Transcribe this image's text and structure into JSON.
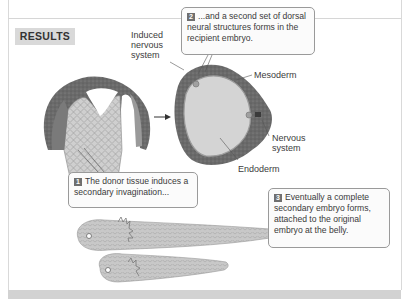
{
  "section_label": "RESULTS",
  "labels": {
    "induced_nervous_system": [
      "Induced",
      "nervous",
      "system"
    ],
    "mesoderm": "Mesoderm",
    "nervous_system": [
      "Nervous",
      "system"
    ],
    "endoderm": "Endoderm"
  },
  "callouts": [
    {
      "number": "1",
      "text_lines": [
        "The donor tissue induces a",
        "secondary invagination..."
      ]
    },
    {
      "number": "2",
      "text_lines": [
        "...and a second set of dorsal",
        "neural structures forms in the",
        "recipient embryo."
      ]
    },
    {
      "number": "3",
      "text_lines": [
        "Eventually a complete",
        "secondary embryo forms,",
        "attached to the original",
        "embryo at the belly."
      ]
    }
  ],
  "figures": {
    "gastrula": "donor-tissue-invagination-illustration",
    "cross_section": "recipient-embryo-cross-section-illustration",
    "tadpoles": "conjoined-secondary-embryo-illustration"
  },
  "colors": {
    "border": "#d9d9d9",
    "label_bg": "#d9d9d9",
    "bottom_band": "#d2d2d2",
    "callout_border": "#9a9a9a",
    "number_badge": "#6f6f6f"
  }
}
